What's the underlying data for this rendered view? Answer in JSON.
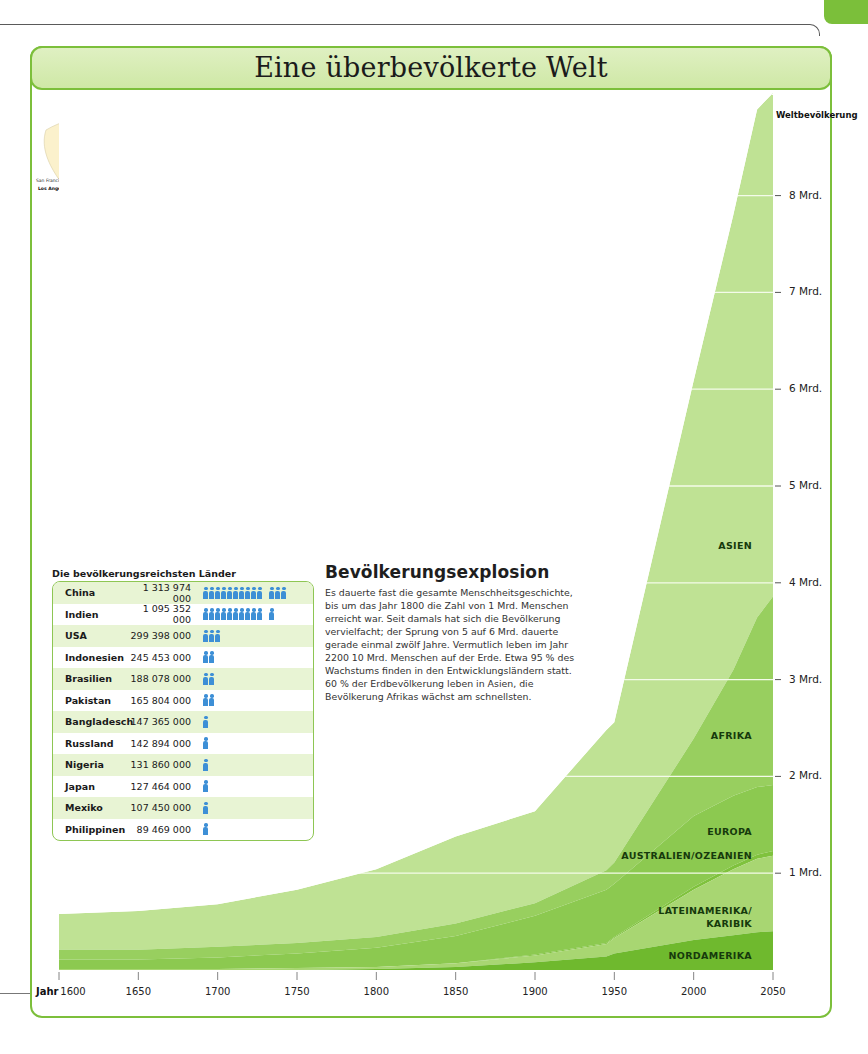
{
  "page": {
    "title": "Eine überbevölkerte Welt"
  },
  "map": {
    "continents": [
      {
        "label": "NORD",
        "x": 60,
        "y": 44
      },
      {
        "label": "AMERIKA",
        "x": 54,
        "y": 57
      },
      {
        "label": "EUROPA",
        "x": 302,
        "y": 73
      },
      {
        "label": "ASIEN",
        "x": 430,
        "y": 56
      },
      {
        "label": "AFRIKA",
        "x": 310,
        "y": 126
      },
      {
        "label": "SÜD-",
        "x": 148,
        "y": 202
      },
      {
        "label": "AMERIKA",
        "x": 132,
        "y": 218
      },
      {
        "label": "AUSTRALIEN",
        "x": 522,
        "y": 228
      }
    ],
    "cities_big": [
      {
        "name": "Los Angeles",
        "x": 2,
        "y": 86
      },
      {
        "name": "New York",
        "x": 130,
        "y": 73
      },
      {
        "name": "Mexiko-Stadt",
        "x": 66,
        "y": 126
      },
      {
        "name": "São Paulo",
        "x": 142,
        "y": 224
      },
      {
        "name": "Rio de Janeiro",
        "x": 180,
        "y": 225
      },
      {
        "name": "Buenos Aires",
        "x": 157,
        "y": 237
      },
      {
        "name": "Rhein-Ruhr*",
        "x": 302,
        "y": 56
      },
      {
        "name": "Kairo",
        "x": 327,
        "y": 107
      },
      {
        "name": "Lagos",
        "x": 312,
        "y": 160
      },
      {
        "name": "Delhi",
        "x": 438,
        "y": 107
      },
      {
        "name": "Karachi",
        "x": 400,
        "y": 116
      },
      {
        "name": "Bombay",
        "x": 407,
        "y": 134
      },
      {
        "name": "Kalkutta",
        "x": 460,
        "y": 124
      },
      {
        "name": "Dhaka",
        "x": 478,
        "y": 119
      },
      {
        "name": "Beijing (Peking)",
        "x": 528,
        "y": 86
      },
      {
        "name": "Shanghai",
        "x": 562,
        "y": 106
      },
      {
        "name": "Tokio",
        "x": 590,
        "y": 92
      },
      {
        "name": "Osaka",
        "x": 583,
        "y": 101
      },
      {
        "name": "Manila",
        "x": 568,
        "y": 142
      },
      {
        "name": "Jakarta",
        "x": 530,
        "y": 175
      }
    ],
    "cities_small": [
      {
        "name": "San Francisco",
        "x": 0,
        "y": 78
      },
      {
        "name": "San Diego",
        "x": 40,
        "y": 88
      },
      {
        "name": "Houston",
        "x": 60,
        "y": 93
      },
      {
        "name": "Dallas",
        "x": 80,
        "y": 89
      },
      {
        "name": "Chicago",
        "x": 86,
        "y": 68
      },
      {
        "name": "Washington D.C.",
        "x": 84,
        "y": 75
      },
      {
        "name": "Philadelphia",
        "x": 128,
        "y": 79
      },
      {
        "name": "Montreal",
        "x": 130,
        "y": 60
      },
      {
        "name": "Boston",
        "x": 140,
        "y": 66
      },
      {
        "name": "Monterrey",
        "x": 44,
        "y": 107
      },
      {
        "name": "Guadalajara",
        "x": 28,
        "y": 118
      },
      {
        "name": "Caracas",
        "x": 126,
        "y": 164
      },
      {
        "name": "Medellín",
        "x": 98,
        "y": 176
      },
      {
        "name": "Bogotá",
        "x": 118,
        "y": 184
      },
      {
        "name": "Lima",
        "x": 106,
        "y": 220
      },
      {
        "name": "Fortaleza",
        "x": 192,
        "y": 198
      },
      {
        "name": "Recife",
        "x": 198,
        "y": 208
      },
      {
        "name": "Salvador",
        "x": 192,
        "y": 220
      },
      {
        "name": "Belo Horizonte",
        "x": 184,
        "y": 232
      },
      {
        "name": "Porto Alegre",
        "x": 172,
        "y": 244
      },
      {
        "name": "Santiago",
        "x": 112,
        "y": 252
      },
      {
        "name": "Lissabon",
        "x": 230,
        "y": 80
      },
      {
        "name": "Casablanca",
        "x": 228,
        "y": 92
      },
      {
        "name": "Moskau",
        "x": 340,
        "y": 44
      },
      {
        "name": "Istanbul",
        "x": 330,
        "y": 84
      },
      {
        "name": "Alexandria",
        "x": 322,
        "y": 100
      },
      {
        "name": "Teheran",
        "x": 388,
        "y": 92
      },
      {
        "name": "Khartum",
        "x": 330,
        "y": 140
      },
      {
        "name": "Addis Abeba",
        "x": 354,
        "y": 156
      },
      {
        "name": "Kinshasa",
        "x": 330,
        "y": 184
      },
      {
        "name": "Luanda",
        "x": 322,
        "y": 196
      },
      {
        "name": "Johannesburg",
        "x": 340,
        "y": 232
      },
      {
        "name": "Kapstadt",
        "x": 322,
        "y": 250
      },
      {
        "name": "Bangalore",
        "x": 440,
        "y": 148
      },
      {
        "name": "Chennai (Madras)",
        "x": 460,
        "y": 148
      },
      {
        "name": "Bangkok",
        "x": 500,
        "y": 140
      },
      {
        "name": "Ho-Chi-Minh-Stadt",
        "x": 524,
        "y": 152
      },
      {
        "name": "Singapur",
        "x": 510,
        "y": 166
      },
      {
        "name": "Bandung",
        "x": 530,
        "y": 182
      },
      {
        "name": "Sydney",
        "x": 620,
        "y": 256
      },
      {
        "name": "Melbourne",
        "x": 604,
        "y": 264
      }
    ]
  },
  "legend": {
    "title": "Legende",
    "items": [
      {
        "label": "Stadt mit 3–5 Mio. Einwohnern",
        "color": "#f6d27a"
      },
      {
        "label": "Stadt mit 5–10 Mio. Einwohnern",
        "color": "#e8a035"
      },
      {
        "label": "Megastadt mit mehr als",
        "color": "#d25a1e"
      },
      {
        "label": "10 Mio. Einwohnern",
        "color": ""
      }
    ],
    "note": "* Zur Stadtregion Rhein-Ruhr gehören Düsseldorf, Essen, Duisburg, Dortmund, Bonn und Köln."
  },
  "density": {
    "title": "BEVÖLKERUNGSDICHTE",
    "unit": "Einwohner pro Quadratkilometer",
    "classes": [
      {
        "label": "unbewohnt",
        "color": "#ffffff"
      },
      {
        "label": "weniger als 1",
        "color": "#fffbe8"
      },
      {
        "label": "1",
        "color": "#fff6cc"
      },
      {
        "label": "10",
        "color": "#fdeeae"
      },
      {
        "label": "25",
        "color": "#fbe08a"
      },
      {
        "label": "50",
        "color": "#f8cc62"
      },
      {
        "label": "100",
        "color": "#f5b646"
      },
      {
        "label": "200",
        "color": "#f29e33"
      },
      {
        "label": "400",
        "color": "#ee8427"
      },
      {
        "label": "800",
        "color": "#e9621c"
      },
      {
        "label": "mehr als 800",
        "color": "#e24813"
      }
    ]
  },
  "countries": {
    "title": "Die bevölkerungsreichsten Länder",
    "icon_unit": "100 Mio.",
    "rows": [
      {
        "name": "China",
        "population": "1 313 974 000",
        "icons": 13
      },
      {
        "name": "Indien",
        "population": "1 095 352 000",
        "icons": 11
      },
      {
        "name": "USA",
        "population": "299 398 000",
        "icons": 3
      },
      {
        "name": "Indonesien",
        "population": "245 453 000",
        "icons": 2
      },
      {
        "name": "Brasilien",
        "population": "188 078 000",
        "icons": 2
      },
      {
        "name": "Pakistan",
        "population": "165 804 000",
        "icons": 2
      },
      {
        "name": "Bangladesch",
        "population": "147 365 000",
        "icons": 1
      },
      {
        "name": "Russland",
        "population": "142 894 000",
        "icons": 1
      },
      {
        "name": "Nigeria",
        "population": "131 860 000",
        "icons": 1
      },
      {
        "name": "Japan",
        "population": "127 464 000",
        "icons": 1
      },
      {
        "name": "Mexiko",
        "population": "107 450 000",
        "icons": 1
      },
      {
        "name": "Philippinen",
        "population": "89 469 000",
        "icons": 1
      }
    ]
  },
  "article": {
    "heading": "Bevölkerungsexplosion",
    "body": "Es dauerte fast die gesamte Menschheitsgeschichte, bis um das Jahr 1800 die Zahl von 1 Mrd. Menschen erreicht war. Seit damals hat sich die Bevölkerung vervielfacht; der Sprung von 5 auf 6 Mrd. dauerte gerade einmal zwölf Jahre. Vermutlich leben im Jahr 2200 10 Mrd. Menschen auf der Erde. Etwa 95 % des Wachstums finden in den Entwicklungsländern statt. 60 % der Erdbevölkerung leben in Asien, die Bevölkerung Afrikas wächst am schnellsten."
  },
  "chart_data": {
    "type": "area",
    "stacked": true,
    "title": "Weltbevölkerung",
    "xlabel": "Jahr",
    "ylabel": "Weltbevölkerung",
    "x": [
      1600,
      1650,
      1700,
      1750,
      1800,
      1850,
      1900,
      1945,
      1950,
      2000,
      2025,
      2040,
      2050
    ],
    "x_ticks": [
      "1600",
      "1650",
      "1700",
      "1750",
      "1800",
      "1850",
      "1900",
      "1950",
      "2000",
      "2050"
    ],
    "y_ticks": [
      "1 Mrd.",
      "2 Mrd.",
      "3 Mrd.",
      "4 Mrd.",
      "5 Mrd.",
      "6 Mrd.",
      "7 Mrd.",
      "8 Mrd."
    ],
    "ylim": [
      0,
      9
    ],
    "unit": "Mrd.",
    "series": [
      {
        "name": "NORDAMERIKA",
        "color": "#6fb92e",
        "values": [
          0.0,
          0.0,
          0.0,
          0.0,
          0.01,
          0.03,
          0.08,
          0.14,
          0.17,
          0.31,
          0.36,
          0.39,
          0.4
        ]
      },
      {
        "name": "LATEINAMERIKA/KARIBIK",
        "color": "#a8d672",
        "values": [
          0.01,
          0.01,
          0.01,
          0.02,
          0.02,
          0.04,
          0.07,
          0.13,
          0.16,
          0.52,
          0.68,
          0.76,
          0.78
        ]
      },
      {
        "name": "AUSTRALIEN/OZEANIEN",
        "color": "#7fc23d",
        "values": [
          0.0,
          0.0,
          0.0,
          0.0,
          0.0,
          0.0,
          0.01,
          0.01,
          0.01,
          0.03,
          0.04,
          0.04,
          0.05
        ]
      },
      {
        "name": "EUROPA",
        "color": "#8cc950",
        "values": [
          0.1,
          0.1,
          0.12,
          0.15,
          0.2,
          0.28,
          0.4,
          0.55,
          0.55,
          0.73,
          0.72,
          0.7,
          0.68
        ]
      },
      {
        "name": "AFRIKA",
        "color": "#98cf5f",
        "values": [
          0.1,
          0.1,
          0.11,
          0.11,
          0.11,
          0.13,
          0.13,
          0.2,
          0.22,
          0.8,
          1.3,
          1.75,
          1.95
        ]
      },
      {
        "name": "ASIEN",
        "color": "#bfe294",
        "values": [
          0.37,
          0.4,
          0.44,
          0.55,
          0.7,
          0.9,
          0.95,
          1.45,
          1.45,
          3.7,
          4.7,
          5.25,
          5.2
        ]
      }
    ],
    "totals": [
      0.58,
      0.61,
      0.68,
      0.83,
      1.04,
      1.38,
      1.64,
      2.48,
      2.56,
      6.09,
      7.8,
      8.89,
      9.06
    ],
    "annotations": [
      "Weltbevölkerung"
    ],
    "grid": "horizontal white lines at each Mrd."
  }
}
